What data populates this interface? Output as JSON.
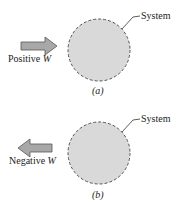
{
  "panels": [
    {
      "id": "a",
      "caption": "(a)",
      "system_label": "System",
      "arrow_label_text": "Positive ",
      "arrow_label_var": "W",
      "arrow_direction": "right"
    },
    {
      "id": "b",
      "caption": "(b)",
      "system_label": "System",
      "arrow_label_text": "Negative ",
      "arrow_label_var": "W",
      "arrow_direction": "left"
    }
  ],
  "colors": {
    "circle_fill": "#d9d9d9",
    "circle_stroke": "#555555",
    "arrow_fill": "#a8a8a8",
    "arrow_stroke": "#555555"
  }
}
